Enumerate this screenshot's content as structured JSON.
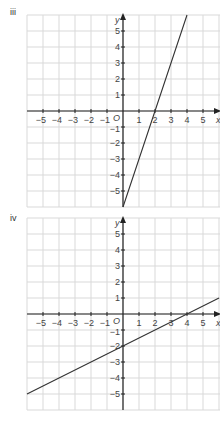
{
  "graphs": [
    {
      "label": "iii"
    },
    {
      "label": "iv"
    }
  ],
  "chart_data": [
    {
      "type": "line",
      "title": "iii",
      "xlabel": "x",
      "ylabel": "y",
      "xlim": [
        -6,
        6
      ],
      "ylim": [
        -6,
        6
      ],
      "x_ticks": [
        -5,
        -4,
        -3,
        -2,
        -1,
        1,
        2,
        3,
        4,
        5
      ],
      "y_ticks": [
        -5,
        -4,
        -3,
        -2,
        -1,
        1,
        2,
        3,
        4,
        5
      ],
      "origin_label": "O",
      "grid": true,
      "series": [
        {
          "name": "line iii",
          "equation": "y = 3x - 6",
          "x": [
            0,
            4
          ],
          "y": [
            -6,
            6
          ]
        }
      ]
    },
    {
      "type": "line",
      "title": "iv",
      "xlabel": "x",
      "ylabel": "y",
      "xlim": [
        -6,
        6
      ],
      "ylim": [
        -6,
        6
      ],
      "x_ticks": [
        -5,
        -4,
        -3,
        -2,
        -1,
        1,
        2,
        3,
        4,
        5
      ],
      "y_ticks": [
        -5,
        -4,
        -3,
        -2,
        -1,
        1,
        2,
        3,
        4,
        5
      ],
      "origin_label": "O",
      "grid": true,
      "series": [
        {
          "name": "line iv",
          "equation": "y = 0.5x - 2",
          "x": [
            -6,
            6
          ],
          "y": [
            -5,
            1
          ]
        }
      ]
    }
  ]
}
